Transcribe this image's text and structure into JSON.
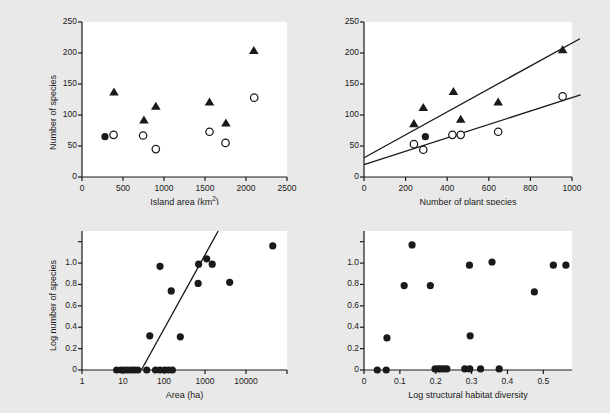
{
  "figure": {
    "background": "#e9e9e9",
    "plot_background": "#ffffff",
    "ink": "#1a1a1a",
    "panels": [
      {
        "key": "a",
        "label": "(a)"
      },
      {
        "key": "b",
        "label": "(b)"
      }
    ]
  },
  "chart_data": [
    {
      "id": "a-left",
      "type": "scatter",
      "title": "",
      "panel": "(a)",
      "xlabel": "Island area (km²)",
      "ylabel": "Number of species",
      "xlim": [
        0,
        2500
      ],
      "ylim": [
        0,
        250
      ],
      "xticks": [
        0,
        500,
        1000,
        1500,
        2000,
        2500
      ],
      "xticklabels": [
        "0",
        "500",
        "1000",
        "1500",
        "2000",
        "2500"
      ],
      "yticks": [
        0,
        50,
        100,
        150,
        200,
        250
      ],
      "yticklabels": [
        "0",
        "50",
        "100",
        "150",
        "200",
        "250"
      ],
      "grid": false,
      "legend": "none",
      "series": [
        {
          "name": "Filled triangles",
          "marker": "filled-triangle",
          "color": "#1a1a1a",
          "points": [
            {
              "x": 390,
              "y": 137
            },
            {
              "x": 755,
              "y": 92
            },
            {
              "x": 900,
              "y": 114
            },
            {
              "x": 1555,
              "y": 121
            },
            {
              "x": 1755,
              "y": 87
            },
            {
              "x": 2095,
              "y": 204
            }
          ]
        },
        {
          "name": "Open circles",
          "marker": "open-circle",
          "color": "#1a1a1a",
          "points": [
            {
              "x": 385,
              "y": 68
            },
            {
              "x": 745,
              "y": 67
            },
            {
              "x": 900,
              "y": 45
            },
            {
              "x": 1555,
              "y": 73
            },
            {
              "x": 1750,
              "y": 55
            },
            {
              "x": 2100,
              "y": 128
            }
          ]
        },
        {
          "name": "Filled circle",
          "marker": "filled-circle",
          "color": "#1a1a1a",
          "points": [
            {
              "x": 280,
              "y": 65
            }
          ]
        }
      ]
    },
    {
      "id": "a-right",
      "type": "scatter",
      "title": "",
      "panel": "(a)",
      "xlabel": "Number of plant species",
      "ylabel": "Number of species",
      "xlim": [
        0,
        1000
      ],
      "ylim": [
        0,
        250
      ],
      "xticks": [
        0,
        200,
        400,
        600,
        800,
        1000
      ],
      "xticklabels": [
        "0",
        "200",
        "400",
        "600",
        "800",
        "1000"
      ],
      "yticks": [
        0,
        50,
        100,
        150,
        200,
        250
      ],
      "yticklabels": [
        "0",
        "50",
        "100",
        "150",
        "200",
        "250"
      ],
      "grid": false,
      "legend": "none",
      "series": [
        {
          "name": "Filled triangles",
          "marker": "filled-triangle",
          "color": "#1a1a1a",
          "points": [
            {
              "x": 240,
              "y": 86
            },
            {
              "x": 285,
              "y": 112
            },
            {
              "x": 430,
              "y": 138
            },
            {
              "x": 465,
              "y": 93
            },
            {
              "x": 645,
              "y": 121
            },
            {
              "x": 955,
              "y": 205
            }
          ]
        },
        {
          "name": "Open circles",
          "marker": "open-circle",
          "color": "#1a1a1a",
          "points": [
            {
              "x": 240,
              "y": 53
            },
            {
              "x": 285,
              "y": 44
            },
            {
              "x": 425,
              "y": 68
            },
            {
              "x": 465,
              "y": 68
            },
            {
              "x": 645,
              "y": 73
            },
            {
              "x": 955,
              "y": 130
            }
          ]
        },
        {
          "name": "Filled circle",
          "marker": "filled-circle",
          "color": "#1a1a1a",
          "points": [
            {
              "x": 295,
              "y": 65
            }
          ]
        }
      ],
      "fit_lines": [
        {
          "name": "Triangle regression",
          "x0": 0,
          "y0": 31,
          "x1": 1000,
          "y1": 216
        },
        {
          "name": "Circle regression",
          "x0": 0,
          "y0": 20,
          "x1": 1000,
          "y1": 128
        }
      ]
    },
    {
      "id": "b-left",
      "type": "scatter",
      "title": "",
      "panel": "(b)",
      "xlabel": "Area (ha)",
      "ylabel": "Log number of species",
      "xscale": "log",
      "xlim": [
        1,
        100000
      ],
      "ylim": [
        0,
        1.3
      ],
      "xticks": [
        1,
        10,
        100,
        1000,
        10000,
        100000
      ],
      "xticklabels": [
        "1",
        "10",
        "100",
        "1000",
        "10000",
        ""
      ],
      "yticks": [
        0,
        0.2,
        0.4,
        0.6,
        0.8,
        1.0,
        1.2
      ],
      "yticklabels": [
        "0",
        "0.2",
        "0.4",
        "0.6",
        "0.8",
        "1.0",
        ""
      ],
      "grid": false,
      "legend": "none",
      "series": [
        {
          "name": "Sites",
          "marker": "filled-circle",
          "color": "#1a1a1a",
          "points": [
            {
              "x": 7,
              "y": 0.0
            },
            {
              "x": 9,
              "y": 0.0
            },
            {
              "x": 11,
              "y": 0.0
            },
            {
              "x": 13,
              "y": 0.0
            },
            {
              "x": 16,
              "y": 0.0
            },
            {
              "x": 19,
              "y": 0.0
            },
            {
              "x": 23,
              "y": 0.0
            },
            {
              "x": 38,
              "y": 0.0
            },
            {
              "x": 62,
              "y": 0.0
            },
            {
              "x": 80,
              "y": 0.0
            },
            {
              "x": 105,
              "y": 0.0
            },
            {
              "x": 130,
              "y": 0.0
            },
            {
              "x": 160,
              "y": 0.0
            },
            {
              "x": 45,
              "y": 0.32
            },
            {
              "x": 250,
              "y": 0.31
            },
            {
              "x": 80,
              "y": 0.97
            },
            {
              "x": 150,
              "y": 0.74
            },
            {
              "x": 680,
              "y": 0.81
            },
            {
              "x": 700,
              "y": 0.99
            },
            {
              "x": 1100,
              "y": 1.04
            },
            {
              "x": 1500,
              "y": 0.99
            },
            {
              "x": 4000,
              "y": 0.82
            },
            {
              "x": 45000,
              "y": 1.16
            }
          ]
        }
      ],
      "fit_lines": [
        {
          "name": "Regression",
          "x0": 28,
          "y0": 0.0,
          "x1": 2100,
          "y1": 1.3
        }
      ]
    },
    {
      "id": "b-right",
      "type": "scatter",
      "title": "",
      "panel": "(b)",
      "xlabel": "Log structural habitat diversity",
      "ylabel": "Log number of species",
      "xlim": [
        0,
        0.58
      ],
      "ylim": [
        0,
        1.3
      ],
      "xticks": [
        0,
        0.1,
        0.2,
        0.3,
        0.4,
        0.5
      ],
      "xticklabels": [
        "0",
        "0.1",
        "0.2",
        "0.3",
        "0.4",
        "0.5"
      ],
      "yticks": [
        0,
        0.2,
        0.4,
        0.6,
        0.8,
        1.0,
        1.2
      ],
      "yticklabels": [
        "0",
        "0.2",
        "0.4",
        "0.6",
        "0.8",
        "1.0",
        ""
      ],
      "grid": false,
      "legend": "none",
      "series": [
        {
          "name": "Sites",
          "marker": "filled-circle",
          "color": "#1a1a1a",
          "points": [
            {
              "x": 0.037,
              "y": 0.0
            },
            {
              "x": 0.062,
              "y": 0.0
            },
            {
              "x": 0.198,
              "y": 0.01
            },
            {
              "x": 0.207,
              "y": 0.01
            },
            {
              "x": 0.214,
              "y": 0.01
            },
            {
              "x": 0.222,
              "y": 0.01
            },
            {
              "x": 0.231,
              "y": 0.01
            },
            {
              "x": 0.281,
              "y": 0.01
            },
            {
              "x": 0.295,
              "y": 0.01
            },
            {
              "x": 0.325,
              "y": 0.01
            },
            {
              "x": 0.377,
              "y": 0.01
            },
            {
              "x": 0.064,
              "y": 0.3
            },
            {
              "x": 0.296,
              "y": 0.32
            },
            {
              "x": 0.112,
              "y": 0.79
            },
            {
              "x": 0.185,
              "y": 0.79
            },
            {
              "x": 0.475,
              "y": 0.73
            },
            {
              "x": 0.294,
              "y": 0.98
            },
            {
              "x": 0.357,
              "y": 1.01
            },
            {
              "x": 0.528,
              "y": 0.98
            },
            {
              "x": 0.563,
              "y": 0.98
            },
            {
              "x": 0.134,
              "y": 1.17
            }
          ]
        }
      ]
    }
  ]
}
